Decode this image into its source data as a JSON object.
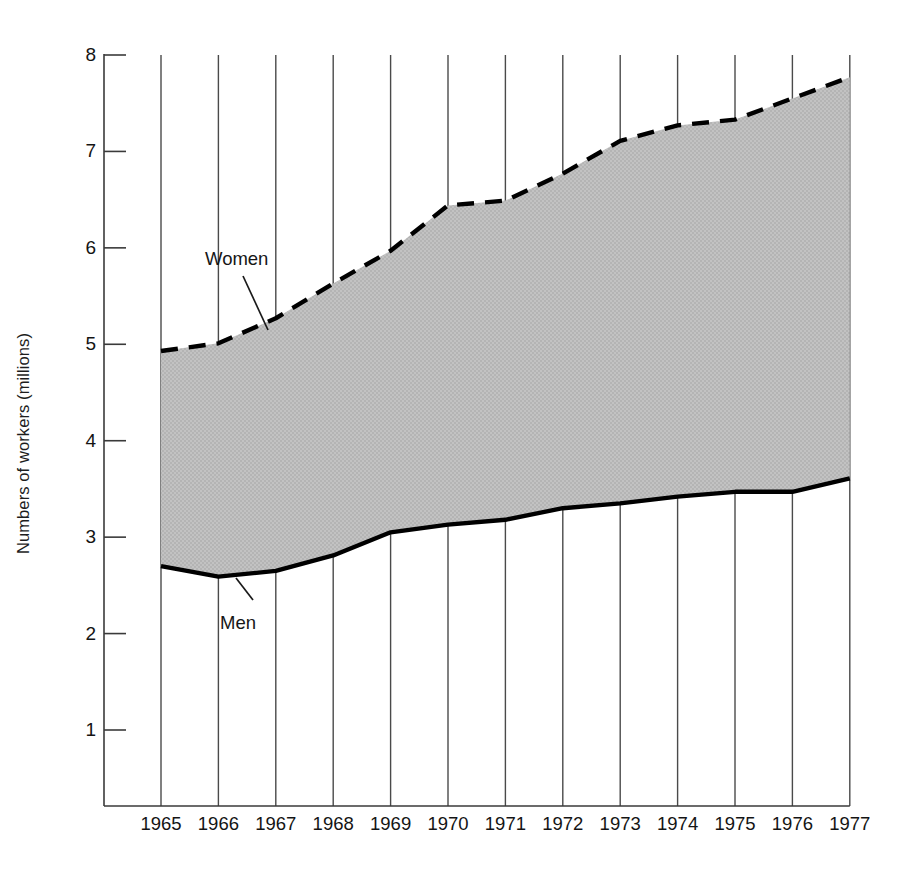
{
  "chart_data": {
    "type": "area",
    "title": "",
    "subtitle": "",
    "xlabel": "",
    "ylabel": "Numbers of workers (millions)",
    "categories": [
      "1965",
      "1966",
      "1967",
      "1968",
      "1969",
      "1970",
      "1971",
      "1972",
      "1973",
      "1974",
      "1975",
      "1976",
      "1977"
    ],
    "x": [
      1965,
      1966,
      1967,
      1968,
      1969,
      1970,
      1971,
      1972,
      1973,
      1974,
      1975,
      1976,
      1977
    ],
    "ylim": [
      0.4,
      8.0
    ],
    "xlim": [
      1965,
      1977
    ],
    "yticks": [
      1,
      2,
      3,
      4,
      5,
      6,
      7,
      8
    ],
    "ytick_labels": [
      "1",
      "2",
      "3",
      "4",
      "5",
      "6",
      "7",
      "8"
    ],
    "grid": "vertical",
    "legend_position": "inline-annotations",
    "fill_between": true,
    "fill_color": "#bdbdbd",
    "series": [
      {
        "name": "Women",
        "style": "dashed",
        "color": "#000000",
        "values": [
          4.93,
          5.01,
          5.27,
          5.63,
          5.97,
          6.44,
          6.49,
          6.77,
          7.11,
          7.27,
          7.33,
          7.55,
          7.77
        ]
      },
      {
        "name": "Men",
        "style": "solid",
        "color": "#000000",
        "values": [
          2.7,
          2.59,
          2.65,
          2.81,
          3.05,
          3.13,
          3.18,
          3.3,
          3.35,
          3.42,
          3.47,
          3.47,
          3.61
        ]
      }
    ],
    "annotations": [
      {
        "text": "Women",
        "target_series": "Women"
      },
      {
        "text": "Men",
        "target_series": "Men"
      }
    ]
  }
}
